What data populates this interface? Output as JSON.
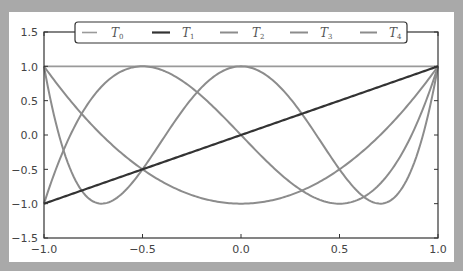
{
  "chart_data": {
    "type": "line",
    "title": "",
    "xlabel": "",
    "ylabel": "",
    "xlim": [
      -1.0,
      1.0
    ],
    "ylim": [
      -1.5,
      1.5
    ],
    "grid": false,
    "legend_position": "upper center (horizontal, 5 columns)",
    "xticks": [
      "-1.0",
      "-0.5",
      "0.0",
      "0.5",
      "1.0"
    ],
    "yticks": [
      "1.5",
      "1.0",
      "0.5",
      "0.0",
      "-0.5",
      "-1.0",
      "-1.5"
    ],
    "series": [
      {
        "name": "T0",
        "label_base": "T",
        "label_sub": "0",
        "formula": "1",
        "color": "#9a9a9a",
        "width": 1.6,
        "x": [
          -1,
          -0.5,
          0,
          0.5,
          1
        ],
        "values": [
          1,
          1,
          1,
          1,
          1
        ]
      },
      {
        "name": "T1",
        "label_base": "T",
        "label_sub": "1",
        "formula": "x",
        "color": "#333333",
        "width": 2.2,
        "x": [
          -1,
          -0.5,
          0,
          0.5,
          1
        ],
        "values": [
          -1,
          -0.5,
          0,
          0.5,
          1
        ]
      },
      {
        "name": "T2",
        "label_base": "T",
        "label_sub": "2",
        "formula": "2x^2-1",
        "color": "#8c8c8c",
        "width": 2.0,
        "x": [
          -1,
          -0.5,
          0,
          0.5,
          1
        ],
        "values": [
          1,
          -0.5,
          -1,
          -0.5,
          1
        ]
      },
      {
        "name": "T3",
        "label_base": "T",
        "label_sub": "3",
        "formula": "4x^3-3x",
        "color": "#8c8c8c",
        "width": 2.0,
        "x": [
          -1,
          -0.5,
          0,
          0.5,
          1
        ],
        "values": [
          -1,
          1,
          0,
          -1,
          1
        ]
      },
      {
        "name": "T4",
        "label_base": "T",
        "label_sub": "4",
        "formula": "8x^4-8x^2+1",
        "color": "#8c8c8c",
        "width": 2.0,
        "x": [
          -1,
          -0.707,
          0,
          0.707,
          1
        ],
        "values": [
          1,
          -1,
          1,
          -1,
          1
        ]
      }
    ]
  },
  "legend": {
    "items": [
      {
        "base": "T",
        "sub": "0"
      },
      {
        "base": "T",
        "sub": "1"
      },
      {
        "base": "T",
        "sub": "2"
      },
      {
        "base": "T",
        "sub": "3"
      },
      {
        "base": "T",
        "sub": "4"
      }
    ]
  },
  "axes": {
    "xticks": [
      "−1.0",
      "−0.5",
      "0.0",
      "0.5",
      "1.0"
    ],
    "yticks": [
      "1.5",
      "1.0",
      "0.5",
      "0.0",
      "−0.5",
      "−1.0",
      "−1.5"
    ]
  }
}
